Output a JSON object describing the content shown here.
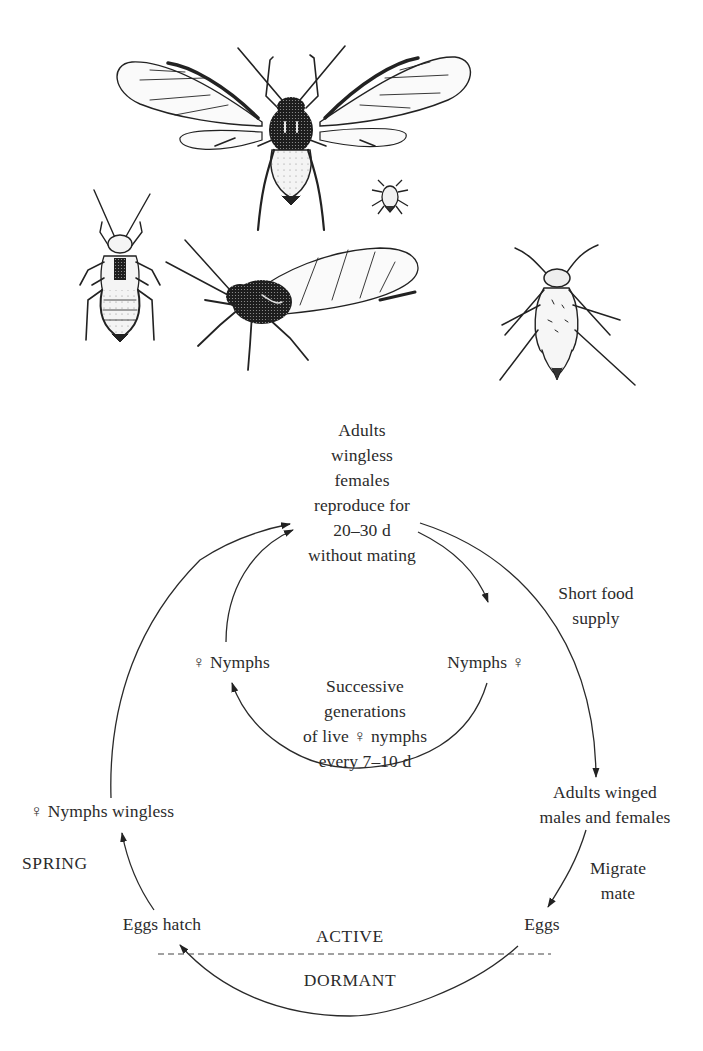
{
  "figure": {
    "type": "aphid life cycle",
    "illustrations": [
      {
        "id": "winged-adult-spread",
        "description": "winged aphid, wings spread, dorsal view"
      },
      {
        "id": "small-nymph",
        "description": "small newborn nymph"
      },
      {
        "id": "wingless-nymph-dorsal",
        "description": "nymph with wing pads, dorsal view"
      },
      {
        "id": "winged-adult-side",
        "description": "winged aphid, side view"
      },
      {
        "id": "wingless-adult-female",
        "description": "wingless adult female, dorsal view"
      }
    ]
  },
  "nodes": {
    "adults_wingless": {
      "line1": "Adults",
      "line2": "wingless",
      "line3": "females",
      "line4": "reproduce for",
      "line5": "20–30 d",
      "line6": "without mating"
    },
    "short_food": {
      "line1": "Short food",
      "line2": "supply"
    },
    "nymphs_left": "♀ Nymphs",
    "nymphs_right": "Nymphs ♀",
    "successive": {
      "line1": "Successive",
      "line2": "generations",
      "line3": "of live ♀ nymphs",
      "line4": "every 7–10 d"
    },
    "adults_winged": {
      "line1": "Adults winged",
      "line2": "males and females"
    },
    "nymphs_wingless": "♀ Nymphs wingless",
    "spring": "SPRING",
    "migrate": {
      "line1": "Migrate",
      "line2": "mate"
    },
    "eggs_hatch": "Eggs hatch",
    "eggs": "Eggs",
    "active": "ACTIVE",
    "dormant": "DORMANT"
  },
  "edges": [
    {
      "from": "Adults wingless females",
      "to": "Nymphs ♀",
      "loop": "inner"
    },
    {
      "from": "Nymphs ♀",
      "to": "♀ Nymphs",
      "via": "Successive generations",
      "loop": "inner"
    },
    {
      "from": "♀ Nymphs",
      "to": "Adults wingless females",
      "loop": "inner"
    },
    {
      "from": "Adults wingless females",
      "to": "Adults winged males and females",
      "label": "Short food supply"
    },
    {
      "from": "Adults winged males and females",
      "to": "Eggs",
      "label": "Migrate mate"
    },
    {
      "from": "Eggs",
      "to": "Eggs hatch",
      "label": "DORMANT"
    },
    {
      "from": "Eggs hatch",
      "to": "♀ Nymphs wingless",
      "label": "SPRING"
    },
    {
      "from": "♀ Nymphs wingless",
      "to": "Adults wingless females"
    }
  ],
  "colors": {
    "line": "#2a2a2a",
    "background": "#ffffff",
    "dash": "#444444"
  }
}
